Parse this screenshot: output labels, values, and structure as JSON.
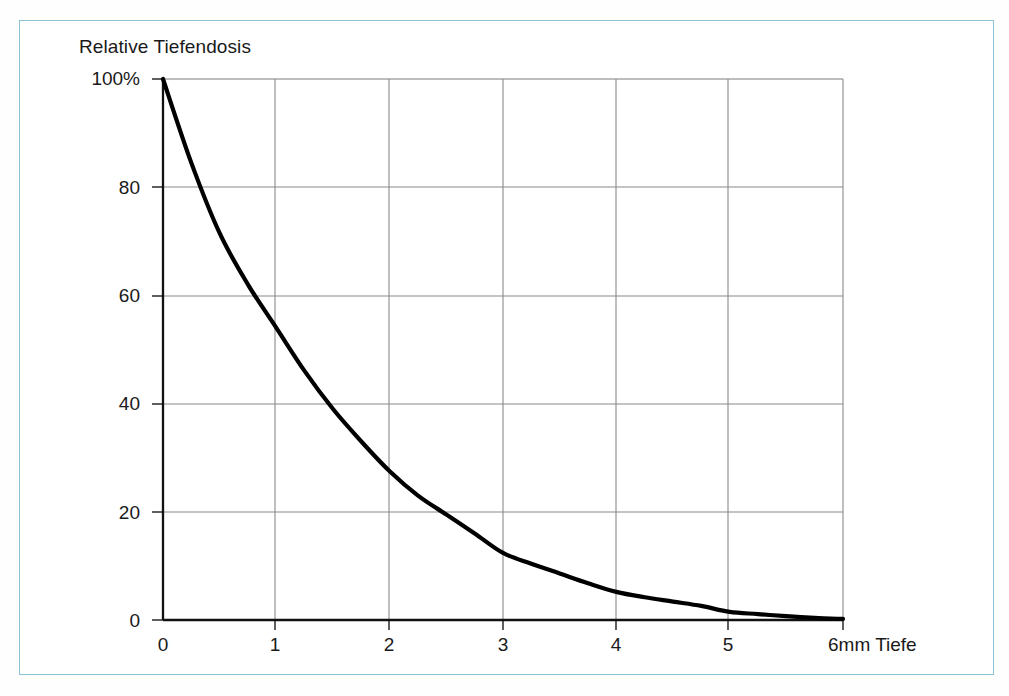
{
  "figure": {
    "title": "Relative Tiefendosis",
    "frame_color": "#8fc3d8",
    "background": "#ffffff",
    "curve_color": "#000000",
    "grid_color": "#8a8a8a",
    "axis_color": "#1a1a1a"
  },
  "chart_data": {
    "type": "line",
    "title": "Relative Tiefendosis",
    "xlabel": "6mm Tiefe",
    "ylabel": "Relative Tiefendosis",
    "xlim": [
      0,
      6
    ],
    "ylim": [
      0,
      100
    ],
    "grid": true,
    "legend": "none",
    "x_ticks": [
      "0",
      "1",
      "2",
      "3",
      "4",
      "5",
      "6mm Tiefe"
    ],
    "x_tick_values": [
      0,
      1,
      2,
      3,
      4,
      5,
      6
    ],
    "y_ticks": [
      "0",
      "20",
      "40",
      "60",
      "80",
      "100%"
    ],
    "y_tick_values": [
      0,
      20,
      40,
      60,
      80,
      100
    ],
    "series": [
      {
        "name": "Relative Tiefendosis",
        "x": [
          0,
          0.25,
          0.5,
          0.75,
          1,
          1.25,
          1.5,
          1.75,
          2,
          2.25,
          2.5,
          2.75,
          3,
          3.25,
          3.5,
          3.75,
          4,
          4.25,
          4.5,
          4.75,
          5,
          5.25,
          5.5,
          5.75,
          6
        ],
        "values": [
          100,
          84.5,
          71.5,
          62,
          54,
          46,
          39,
          33,
          27.5,
          23,
          19.5,
          16,
          12.4,
          10.4,
          8.6,
          6.8,
          5.2,
          4.2,
          3.4,
          2.6,
          1.5,
          1.1,
          0.7,
          0.4,
          0.2
        ]
      }
    ]
  }
}
